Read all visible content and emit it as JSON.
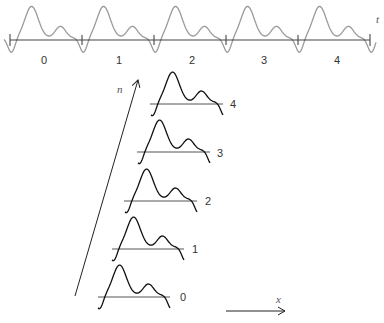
{
  "diagram": {
    "top_axis": {
      "label": "t",
      "segment_labels": [
        "0",
        "1",
        "2",
        "3",
        "4"
      ],
      "wave_color": "#999999",
      "axis_color": "#444444"
    },
    "stack": {
      "axis_label": "n",
      "curve_labels": [
        "0",
        "1",
        "2",
        "3",
        "4"
      ],
      "curve_color": "#111111",
      "baseline_color": "#444444"
    },
    "x_arrow": {
      "label": "x"
    }
  }
}
